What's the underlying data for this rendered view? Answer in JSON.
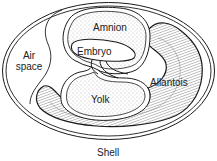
{
  "diagram": {
    "labels": {
      "amnion": "Amnion",
      "embryo": "Embryo",
      "air_space_line1": "Air",
      "air_space_line2": "space",
      "allantois": "Allantois",
      "yolk": "Yolk",
      "shell": "Shell"
    },
    "colors": {
      "line": "#1a1a1a",
      "stipple": "#9a9a9a",
      "background": "#ffffff"
    }
  }
}
